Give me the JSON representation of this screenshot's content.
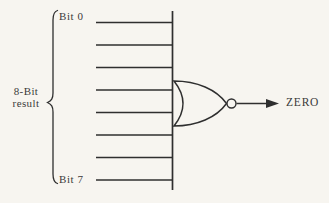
{
  "diagram": {
    "labels": {
      "bit_top": "Bit 0",
      "bit_bottom": "Bit 7",
      "result_line1": "8-Bit",
      "result_line2": "result",
      "output": "ZERO"
    },
    "bit_line_count": 8,
    "gate": "nor-gate",
    "colors": {
      "line": "#2f2f2f",
      "text": "#3b3b3b",
      "background": "#f7f5f0"
    }
  }
}
